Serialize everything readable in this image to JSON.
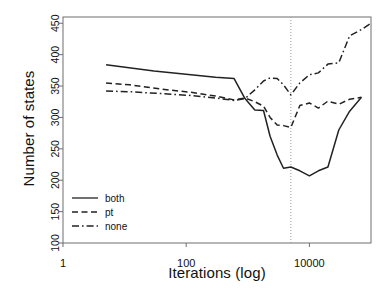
{
  "chart_data": {
    "type": "line",
    "title": "",
    "xlabel": "Iterations (log)",
    "ylabel": "Number of states",
    "xscale": "log",
    "xlim": [
      1,
      100000
    ],
    "ylim": [
      100,
      460
    ],
    "xticks": [
      1,
      100,
      10000
    ],
    "xtick_labels": [
      "1",
      "100",
      "10000"
    ],
    "yticks": [
      100,
      150,
      200,
      250,
      300,
      350,
      400,
      450
    ],
    "ytick_labels": [
      "100",
      "150",
      "200",
      "250",
      "300",
      "350",
      "400",
      "450"
    ],
    "grid": false,
    "legend_position": "bottom-left",
    "annotations": [
      {
        "type": "vline",
        "x": 5000,
        "style": "dotted",
        "color": "#9a9a9a"
      }
    ],
    "series": [
      {
        "name": "both",
        "style": "solid",
        "color": "#222222",
        "points": [
          [
            5,
            384
          ],
          [
            30,
            374
          ],
          [
            300,
            364
          ],
          [
            600,
            362
          ],
          [
            900,
            330
          ],
          [
            1300,
            312
          ],
          [
            1800,
            311
          ],
          [
            2300,
            270
          ],
          [
            3000,
            240
          ],
          [
            3800,
            219
          ],
          [
            5000,
            221
          ],
          [
            7000,
            215
          ],
          [
            10000,
            207
          ],
          [
            14000,
            215
          ],
          [
            20000,
            221
          ],
          [
            30000,
            280
          ],
          [
            45000,
            310
          ],
          [
            70000,
            332
          ]
        ]
      },
      {
        "name": "pt",
        "style": "dashed",
        "color": "#222222",
        "points": [
          [
            5,
            355
          ],
          [
            12,
            352
          ],
          [
            40,
            345
          ],
          [
            120,
            340
          ],
          [
            300,
            334
          ],
          [
            600,
            328
          ],
          [
            900,
            331
          ],
          [
            1300,
            325
          ],
          [
            1800,
            318
          ],
          [
            2300,
            300
          ],
          [
            3000,
            288
          ],
          [
            3800,
            287
          ],
          [
            5000,
            284
          ],
          [
            7000,
            319
          ],
          [
            10000,
            323
          ],
          [
            14000,
            315
          ],
          [
            20000,
            326
          ],
          [
            30000,
            321
          ],
          [
            45000,
            329
          ],
          [
            70000,
            332
          ]
        ]
      },
      {
        "name": "none",
        "style": "dashdot",
        "color": "#222222",
        "points": [
          [
            5,
            342
          ],
          [
            12,
            341
          ],
          [
            40,
            338
          ],
          [
            120,
            335
          ],
          [
            300,
            331
          ],
          [
            600,
            327
          ],
          [
            900,
            330
          ],
          [
            1300,
            344
          ],
          [
            1800,
            358
          ],
          [
            2300,
            363
          ],
          [
            3000,
            362
          ],
          [
            3800,
            352
          ],
          [
            5000,
            336
          ],
          [
            7000,
            355
          ],
          [
            10000,
            368
          ],
          [
            14000,
            371
          ],
          [
            20000,
            385
          ],
          [
            30000,
            387
          ],
          [
            45000,
            430
          ],
          [
            70000,
            440
          ],
          [
            100000,
            450
          ]
        ]
      }
    ],
    "legend": [
      {
        "label": "both",
        "style": "solid"
      },
      {
        "label": "pt",
        "style": "dashed"
      },
      {
        "label": "none",
        "style": "dashdot"
      }
    ]
  }
}
